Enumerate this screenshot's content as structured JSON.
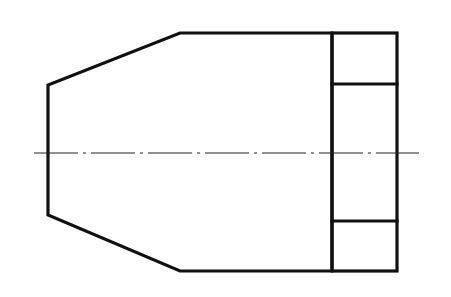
{
  "drawing": {
    "type": "orthographic-view",
    "description": "Side view of a chamfered cylindrical part with a flanged/hex end and dash-dot center axis",
    "colors": {
      "background": "#ffffff",
      "line": "#111111",
      "centerline": "#222222"
    },
    "body_outline": {
      "points": [
        [
          180,
          33
        ],
        [
          332,
          33
        ],
        [
          332,
          271
        ],
        [
          180,
          271
        ],
        [
          48,
          215
        ],
        [
          48,
          85
        ]
      ]
    },
    "end_block": {
      "x": 332,
      "y": 33,
      "width": 65,
      "height": 238,
      "inner_lines_y": [
        84,
        221
      ]
    },
    "center_axis": {
      "y": 153,
      "x_start": 34,
      "x_end": 419,
      "dash_pattern": "44 5 3 5"
    }
  }
}
